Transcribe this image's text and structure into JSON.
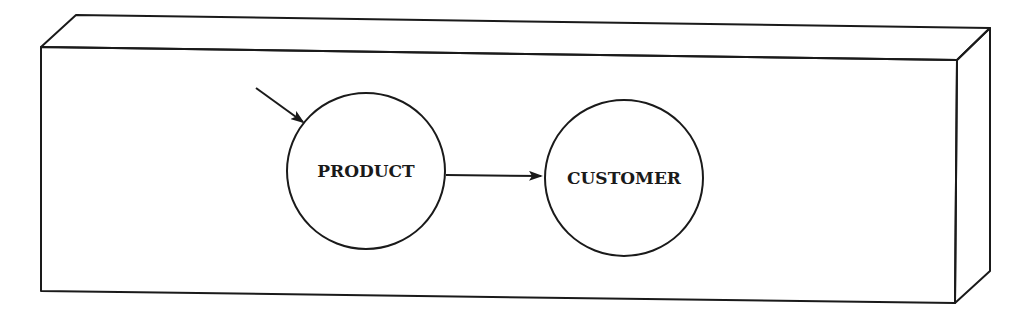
{
  "diagram": {
    "type": "flow",
    "container": "3d-box",
    "nodes": [
      {
        "id": "product",
        "label": "PRODUCT"
      },
      {
        "id": "customer",
        "label": "CUSTOMER"
      }
    ],
    "edges": [
      {
        "from": "external",
        "to": "product"
      },
      {
        "from": "product",
        "to": "customer"
      }
    ],
    "stroke_color": "#1a1a1a",
    "background_color": "#ffffff"
  }
}
